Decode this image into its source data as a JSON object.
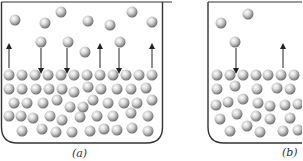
{
  "figure": {
    "panels": [
      {
        "id": "a",
        "caption": "(a)",
        "caption_pos": [
          72,
          147
        ],
        "beaker": {
          "left": 1.5,
          "right": 162.5,
          "top": 2,
          "bottom": 143,
          "rim_extend_right": 172,
          "corner_radius": 16
        },
        "vapor_molecules": [
          [
            15,
            20
          ],
          [
            45,
            23
          ],
          [
            61,
            12
          ],
          [
            88,
            21
          ],
          [
            110,
            25
          ],
          [
            132,
            12
          ],
          [
            152,
            22
          ]
        ],
        "escaping_molecules": [
          [
            41,
            42
          ],
          [
            68,
            42
          ],
          [
            85,
            52
          ],
          [
            120,
            42
          ]
        ],
        "arrows": [
          {
            "x": 9,
            "from": 68,
            "to": 46,
            "direction": "up"
          },
          {
            "x": 41,
            "from": 48,
            "to": 71,
            "direction": "down"
          },
          {
            "x": 67,
            "from": 48,
            "to": 71,
            "direction": "down"
          },
          {
            "x": 100,
            "from": 68,
            "to": 46,
            "direction": "up"
          },
          {
            "x": 119,
            "from": 48,
            "to": 71,
            "direction": "down"
          },
          {
            "x": 152,
            "from": 68,
            "to": 46,
            "direction": "up"
          }
        ],
        "liquid_molecules": [
          [
            9,
            75
          ],
          [
            22,
            75
          ],
          [
            35,
            75
          ],
          [
            48,
            75
          ],
          [
            61,
            75
          ],
          [
            74,
            75
          ],
          [
            87,
            75
          ],
          [
            100,
            75
          ],
          [
            113,
            75
          ],
          [
            126,
            75
          ],
          [
            139,
            75
          ],
          [
            152,
            75
          ],
          [
            9,
            89
          ],
          [
            22,
            89
          ],
          [
            36,
            89
          ],
          [
            49,
            89
          ],
          [
            62,
            89
          ],
          [
            74,
            92
          ],
          [
            88,
            87
          ],
          [
            101,
            89
          ],
          [
            117,
            89
          ],
          [
            131,
            89
          ],
          [
            146,
            88
          ],
          [
            14,
            103
          ],
          [
            27,
            103
          ],
          [
            43,
            103
          ],
          [
            57,
            100
          ],
          [
            70,
            107
          ],
          [
            83,
            107
          ],
          [
            93,
            100
          ],
          [
            108,
            103
          ],
          [
            124,
            103
          ],
          [
            137,
            103
          ],
          [
            152,
            100
          ],
          [
            9,
            116
          ],
          [
            21,
            116
          ],
          [
            33,
            118
          ],
          [
            50,
            116
          ],
          [
            62,
            120
          ],
          [
            80,
            117
          ],
          [
            97,
            116
          ],
          [
            113,
            116
          ],
          [
            131,
            113
          ],
          [
            148,
            116
          ],
          [
            22,
            131
          ],
          [
            42,
            129
          ],
          [
            56,
            132
          ],
          [
            72,
            132
          ],
          [
            90,
            131
          ],
          [
            104,
            129
          ],
          [
            117,
            130
          ],
          [
            132,
            128
          ],
          [
            148,
            131
          ]
        ]
      },
      {
        "id": "b",
        "caption": "(b)",
        "caption_pos": [
          282,
          146
        ],
        "beaker": {
          "left": 208,
          "right": 320,
          "top": 2,
          "bottom": 143,
          "corner_radius": 16
        },
        "vapor_molecules": [
          [
            221,
            23
          ],
          [
            248,
            14
          ]
        ],
        "escaping_molecules": [
          [
            235,
            42
          ]
        ],
        "arrows": [
          {
            "x": 236,
            "from": 48,
            "to": 71,
            "direction": "down"
          },
          {
            "x": 283,
            "from": 68,
            "to": 46,
            "direction": "up"
          }
        ],
        "liquid_molecules": [
          [
            217,
            75
          ],
          [
            230,
            75
          ],
          [
            243,
            75
          ],
          [
            256,
            75
          ],
          [
            268,
            75
          ],
          [
            281,
            75
          ],
          [
            294,
            75
          ],
          [
            217,
            89
          ],
          [
            235,
            86
          ],
          [
            257,
            89
          ],
          [
            277,
            88
          ],
          [
            290,
            89
          ],
          [
            216,
            105
          ],
          [
            228,
            102
          ],
          [
            243,
            99
          ],
          [
            258,
            103
          ],
          [
            270,
            106
          ],
          [
            285,
            105
          ],
          [
            298,
            104
          ],
          [
            220,
            119
          ],
          [
            237,
            114
          ],
          [
            256,
            116
          ],
          [
            270,
            119
          ],
          [
            290,
            118
          ],
          [
            230,
            131
          ],
          [
            247,
            126
          ],
          [
            260,
            132
          ],
          [
            283,
            131
          ],
          [
            298,
            130
          ]
        ]
      }
    ],
    "colors": {
      "line": "#333333",
      "arrow": "#222222",
      "sphere_highlight": "#ffffff",
      "sphere_mid": "#c8c8c8",
      "sphere_shadow": "#7a7a7a"
    },
    "molecule_radius": 5.5
  }
}
